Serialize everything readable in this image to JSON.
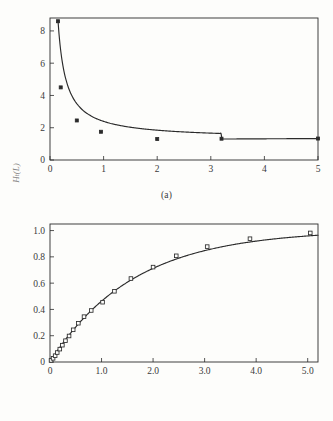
{
  "figure": {
    "background_color": "#fdfdfb",
    "line_color": "#2b2b2b",
    "panel_a_caption": "(a)",
    "panel_b_caption": "(b)"
  },
  "chart_data": [
    {
      "type": "line",
      "panel": "a",
      "title": "",
      "xlabel": "",
      "ylabel": "Hₜ(L)",
      "xlim": [
        0,
        5
      ],
      "ylim": [
        0,
        8.8
      ],
      "grid": false,
      "legend": false,
      "marker": "filled-square",
      "xticks": [
        0,
        1,
        2,
        3,
        4,
        5
      ],
      "xtick_labels": [
        "0",
        "1",
        "2",
        "3",
        "4",
        "5"
      ],
      "yticks": [
        0,
        2,
        4,
        6,
        8
      ],
      "ytick_labels": [
        "0",
        "2",
        "4",
        "6",
        "8"
      ],
      "x": [
        0.15,
        0.2,
        0.5,
        0.95,
        2.0,
        3.2,
        5.0
      ],
      "values": [
        8.6,
        4.5,
        2.45,
        1.75,
        1.3,
        1.32,
        1.33
      ]
    },
    {
      "type": "line",
      "panel": "b",
      "title": "",
      "xlabel": "L",
      "ylabel": "",
      "xlim": [
        0,
        5.2
      ],
      "ylim": [
        0,
        1.05
      ],
      "grid": false,
      "legend": false,
      "marker": "open-square",
      "xticks": [
        0,
        1.0,
        2.0,
        3.0,
        4.0,
        5.0
      ],
      "xtick_labels": [
        "0",
        "1.0",
        "2.0",
        "3.0",
        "4.0",
        "5.0"
      ],
      "yticks": [
        0,
        0.2,
        0.4,
        0.6,
        0.8,
        1.0
      ],
      "ytick_labels": [
        "0",
        "0.2",
        "0.4",
        "0.6",
        "0.8",
        "1.0"
      ],
      "x": [
        0.02,
        0.06,
        0.1,
        0.14,
        0.19,
        0.24,
        0.3,
        0.37,
        0.45,
        0.55,
        0.66,
        0.8,
        1.02,
        1.25,
        1.57,
        2.0,
        2.45,
        3.05,
        3.88,
        5.05
      ],
      "values": [
        0.012,
        0.028,
        0.048,
        0.072,
        0.098,
        0.128,
        0.162,
        0.198,
        0.245,
        0.295,
        0.345,
        0.392,
        0.455,
        0.538,
        0.635,
        0.722,
        0.808,
        0.878,
        0.938,
        0.982,
        1.005
      ]
    }
  ]
}
